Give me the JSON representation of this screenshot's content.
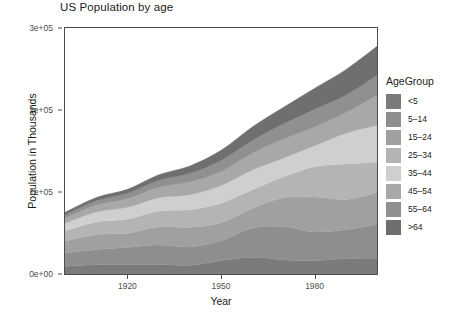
{
  "chart_data": {
    "type": "area",
    "stacked": true,
    "title": "US Population by age",
    "xlabel": "Year",
    "ylabel": "Population in Thousands",
    "xlim": [
      1900,
      2000
    ],
    "ylim": [
      0,
      300000
    ],
    "grid": false,
    "legend_position": "right",
    "legend_title": "AgeGroup",
    "x_ticks": [
      1920,
      1950,
      1980
    ],
    "x_tick_labels": [
      "1920",
      "1950",
      "1980"
    ],
    "y_ticks": [
      0,
      100000,
      200000,
      300000
    ],
    "y_tick_labels": [
      "0e+00",
      "1e+05",
      "2e+05",
      "3e+05"
    ],
    "x": [
      1900,
      1910,
      1920,
      1930,
      1940,
      1950,
      1960,
      1970,
      1980,
      1990,
      2000
    ],
    "series": [
      {
        "name": "<5",
        "color": "#7b7b7b",
        "values": [
          9171,
          11232,
          11573,
          11444,
          10541,
          16163,
          20341,
          17166,
          16348,
          18758,
          19176
        ]
      },
      {
        "name": "5-14",
        "color": "#8e8e8e",
        "values": [
          16205,
          18659,
          20768,
          23878,
          22431,
          24319,
          35465,
          40746,
          34942,
          35095,
          41078
        ]
      },
      {
        "name": "15-24",
        "color": "#a0a0a0",
        "values": [
          14951,
          18121,
          17344,
          22422,
          24033,
          22098,
          24020,
          35441,
          42487,
          37013,
          39184
        ]
      },
      {
        "name": "25-34",
        "color": "#b4b4b4",
        "values": [
          12161,
          15469,
          17333,
          18932,
          21339,
          23759,
          22818,
          24907,
          37082,
          43176,
          37233
        ]
      },
      {
        "name": "35-44",
        "color": "#cfcfcf",
        "values": [
          9273,
          12011,
          14243,
          16328,
          18333,
          21450,
          24081,
          23088,
          25634,
          37579,
          44659
        ]
      },
      {
        "name": "45-54",
        "color": "#a8a8a8",
        "values": [
          6438,
          8622,
          10572,
          12923,
          15512,
          17343,
          20485,
          23220,
          22800,
          25223,
          37030
        ]
      },
      {
        "name": "55-64",
        "color": "#909090",
        "values": [
          4027,
          5264,
          6532,
          8397,
          10572,
          13370,
          15572,
          18590,
          21703,
          21148,
          24275
        ]
      },
      {
        "name": ">64",
        "color": "#6f6f6f",
        "values": [
          3080,
          3950,
          4933,
          6634,
          9019,
          12270,
          16560,
          20066,
          25549,
          31242,
          34992
        ]
      }
    ]
  },
  "chart": {
    "title": "US Population by age",
    "x_axis_title": "Year",
    "y_axis_title": "Population in Thousands",
    "y_tick_labels": [
      "3e+05",
      "2e+05",
      "1e+05",
      "0e+00"
    ],
    "x_tick_labels": [
      "1920",
      "1950",
      "1980"
    ]
  },
  "legend": {
    "title": "AgeGroup",
    "items": [
      {
        "label": "<5",
        "color": "#7b7b7b"
      },
      {
        "label": "5–14",
        "color": "#8e8e8e"
      },
      {
        "label": "15–24",
        "color": "#a0a0a0"
      },
      {
        "label": "25–34",
        "color": "#b4b4b4"
      },
      {
        "label": "35–44",
        "color": "#cfcfcf"
      },
      {
        "label": "45–54",
        "color": "#a8a8a8"
      },
      {
        "label": "55–64",
        "color": "#909090"
      },
      {
        "label": ">64",
        "color": "#6f6f6f"
      }
    ]
  }
}
